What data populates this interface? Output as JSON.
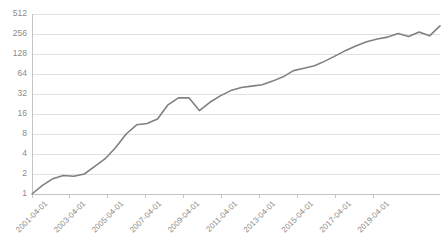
{
  "chart_data": {
    "type": "line",
    "title": "",
    "subtitle": "",
    "xlabel": "",
    "ylabel": "",
    "yscale": "log2",
    "ylim": [
      1,
      512
    ],
    "grid": true,
    "legend": null,
    "legend_position": "none",
    "line_color": "#808080",
    "gridline_color": "#d9d9d9",
    "axis_color": "#bfbfbf",
    "tick_label_color": "#8a8a8a",
    "ytick_labels": [
      "512",
      "256",
      "128",
      "64",
      "32",
      "16",
      "8",
      "4",
      "2",
      "1"
    ],
    "ytick_values": [
      512,
      256,
      128,
      64,
      32,
      16,
      8,
      4,
      2,
      1
    ],
    "xtick_labels": [
      "2001-04-01",
      "2003-04-01",
      "2005-04-01",
      "2007-04-01",
      "2009-04-01",
      "2011-04-01",
      "2013-04-01",
      "2015-04-01",
      "2017-04-01",
      "2019-04-01"
    ],
    "xlim": [
      "2001-04-01",
      "2020-10-01"
    ],
    "x": [
      "2001-04-01",
      "2001-10-01",
      "2002-04-01",
      "2002-10-01",
      "2003-04-01",
      "2003-10-01",
      "2004-04-01",
      "2004-10-01",
      "2005-04-01",
      "2005-10-01",
      "2006-04-01",
      "2006-10-01",
      "2007-04-01",
      "2007-10-01",
      "2008-04-01",
      "2008-10-01",
      "2009-04-01",
      "2009-10-01",
      "2010-04-01",
      "2010-10-01",
      "2011-04-01",
      "2011-10-01",
      "2012-04-01",
      "2012-10-01",
      "2013-04-01",
      "2013-10-01",
      "2014-04-01",
      "2014-10-01",
      "2015-04-01",
      "2015-10-01",
      "2016-04-01",
      "2016-10-01",
      "2017-04-01",
      "2017-10-01",
      "2018-04-01",
      "2018-10-01",
      "2019-04-01",
      "2019-10-01",
      "2020-04-01",
      "2020-10-01"
    ],
    "values": [
      1.0,
      1.35,
      1.7,
      1.9,
      1.85,
      2.0,
      2.6,
      3.4,
      5.0,
      8.0,
      11.0,
      11.5,
      13.5,
      22.0,
      28.0,
      28.0,
      18.0,
      24.0,
      30.0,
      36.0,
      40.0,
      42.0,
      44.0,
      50.0,
      58.0,
      72.0,
      78.0,
      85.0,
      100.0,
      120.0,
      145.0,
      170.0,
      195.0,
      215.0,
      230.0,
      260.0,
      235.0,
      275.0,
      240.0,
      340.0
    ],
    "series": [
      {
        "name": "",
        "color": "#808080",
        "values": [
          1.0,
          1.35,
          1.7,
          1.9,
          1.85,
          2.0,
          2.6,
          3.4,
          5.0,
          8.0,
          11.0,
          11.5,
          13.5,
          22.0,
          28.0,
          28.0,
          18.0,
          24.0,
          30.0,
          36.0,
          40.0,
          42.0,
          44.0,
          50.0,
          58.0,
          72.0,
          78.0,
          85.0,
          100.0,
          120.0,
          145.0,
          170.0,
          195.0,
          215.0,
          230.0,
          260.0,
          235.0,
          275.0,
          240.0,
          340.0
        ]
      }
    ],
    "annotations": []
  }
}
